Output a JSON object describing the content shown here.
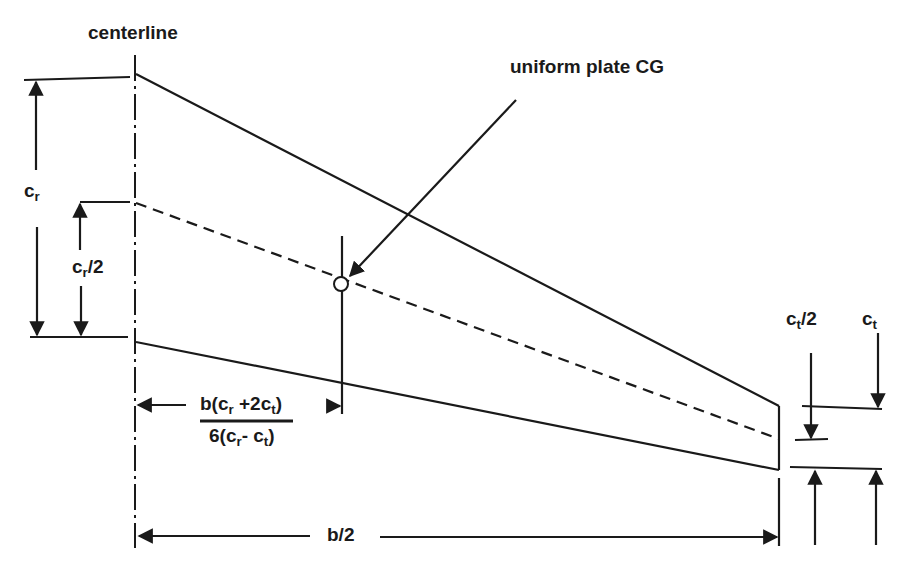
{
  "diagram": {
    "colors": {
      "line": "#1a1a1a",
      "background": "#ffffff"
    },
    "labels": {
      "centerline": "centerline",
      "cg_annotation": "uniform plate CG",
      "root_chord": {
        "base": "c",
        "sub": "r"
      },
      "root_half_chord": {
        "base": "c",
        "sub": "r",
        "suffix": "/2"
      },
      "tip_chord": {
        "base": "c",
        "sub": "t"
      },
      "tip_half_chord": {
        "base": "c",
        "sub": "t",
        "suffix": "/2"
      },
      "semispan": "b/2",
      "cg_formula_numerator": {
        "p1": "b(c",
        "s1": "r",
        "p2": " +2c",
        "s2": "t",
        "p3": ")"
      },
      "cg_formula_denominator": {
        "p1": "6(c",
        "s1": "r",
        "p2": "- c",
        "s2": "t",
        "p3": ")"
      }
    },
    "elements": [
      "leading-edge",
      "trailing-edge",
      "mid-chord-dashed-line",
      "centerline-dash-dot",
      "tip-edge",
      "cg-marker-circle",
      "cg-leader-arrow",
      "dimension-arrows"
    ]
  }
}
